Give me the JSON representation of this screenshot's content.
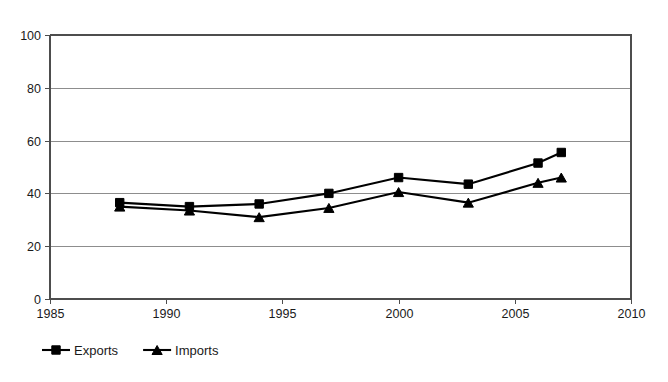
{
  "chart_data": {
    "type": "line",
    "title": "",
    "subtitle": "",
    "xlabel": "",
    "ylabel": "",
    "xlim": [
      1985,
      2010
    ],
    "ylim": [
      0,
      100
    ],
    "grid": true,
    "legend_position": "bottom-left",
    "x": [
      1988,
      1991,
      1994,
      1997,
      2000,
      2003,
      2006,
      2007
    ],
    "xticks": [
      "1985",
      "1990",
      "1995",
      "2000",
      "2005",
      "2010"
    ],
    "xtick_values": [
      1985,
      1990,
      1995,
      2000,
      2005,
      2010
    ],
    "yticks": [
      "0",
      "20",
      "40",
      "60",
      "80",
      "100"
    ],
    "ytick_values": [
      0,
      20,
      40,
      60,
      80,
      100
    ],
    "series": [
      {
        "name": "Exports",
        "marker": "square",
        "color": "#000000",
        "values": [
          36.5,
          35,
          36,
          40,
          46,
          43.5,
          51.5,
          55.5
        ]
      },
      {
        "name": "Imports",
        "marker": "triangle",
        "color": "#000000",
        "values": [
          35,
          33.5,
          31,
          34.5,
          40.5,
          36.5,
          44,
          46
        ]
      }
    ]
  },
  "legend": {
    "entries": [
      {
        "label": "Exports",
        "marker": "square-marker-icon"
      },
      {
        "label": "Imports",
        "marker": "triangle-marker-icon"
      }
    ]
  }
}
